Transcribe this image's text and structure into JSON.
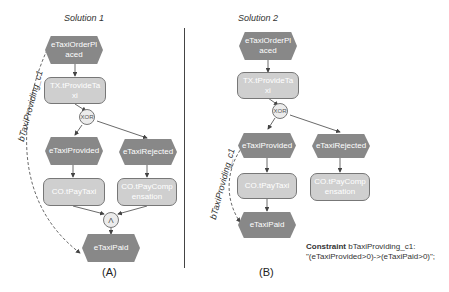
{
  "solution1": {
    "title": "Solution 1",
    "caption": "(A)",
    "constraint_label": "bTaxiProviding_c1",
    "nodes": {
      "order_placed": "eTaxiOrderPl\naced",
      "provide_taxi": "TX.tProvideTa\nxi",
      "xor": "XOR",
      "provided": "eTaxiProvided",
      "rejected": "eTaxiRejected",
      "pay_taxi": "CO.tPayTaxi",
      "pay_comp": "CO.tPayComp\nensation",
      "and": "Λ",
      "paid": "eTaxiPaid"
    }
  },
  "solution2": {
    "title": "Solution 2",
    "caption": "(B)",
    "constraint_label": "bTaxiProviding_c1",
    "nodes": {
      "order_placed": "eTaxiOrderPl\naced",
      "provide_taxi": "TX.tProvideTa\nxi",
      "xor": "XOR",
      "provided": "eTaxiProvided",
      "rejected": "eTaxiRejected",
      "pay_taxi": "CO.tPayTaxi",
      "pay_comp": "CO.tPayComp\nensation",
      "paid": "eTaxiPaid"
    },
    "constraint": {
      "keyword": "Constraint",
      "name": "bTaxiProviding_c1:",
      "expression": "\"(eTaxiProvided>0)->(eTaxiPaid>0)\";"
    }
  },
  "colors": {
    "event": "#8c8c8c",
    "function": "#cfcfcf",
    "gateway": "#ececec",
    "line": "#444444"
  }
}
